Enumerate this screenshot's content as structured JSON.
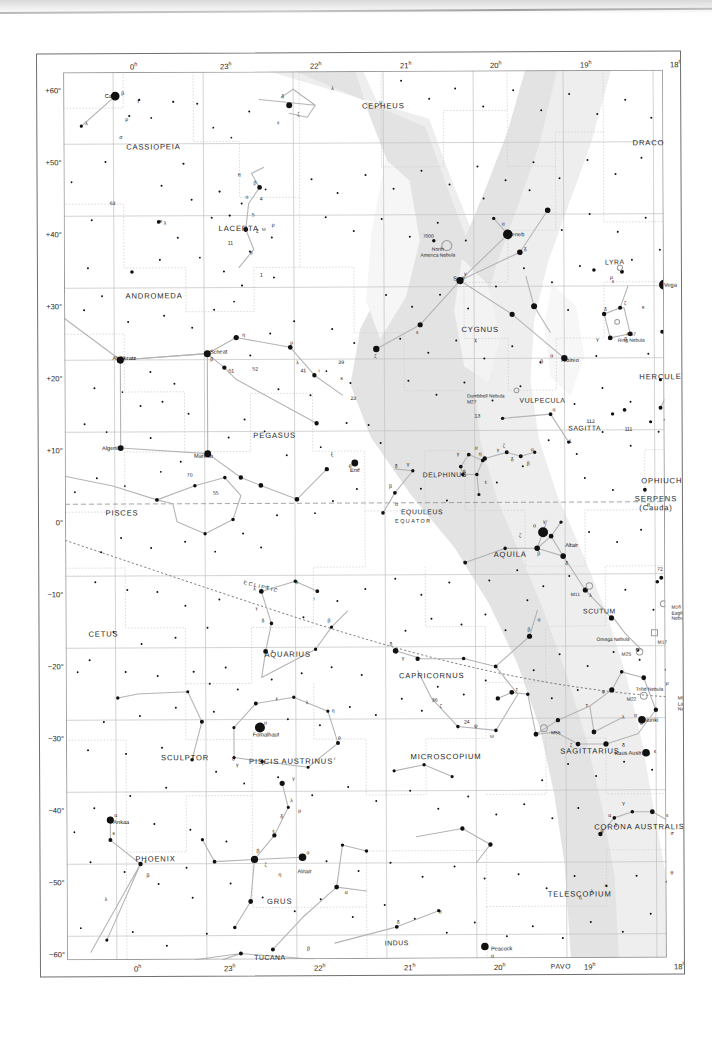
{
  "chart_data": {
    "type": "scatter",
    "projection": "equatorial / cylindrical",
    "xlabel": "Right Ascension",
    "ylabel": "Declination",
    "xlim": [
      0,
      18
    ],
    "ylim": [
      -60,
      60
    ],
    "grid": true,
    "ra_hours_ticks": [
      "0",
      "23",
      "22",
      "21",
      "20",
      "19",
      "18"
    ],
    "ra_tick_labels": [
      "0ʰ",
      "23ʰ",
      "22ʰ",
      "21ʰ",
      "20ʰ",
      "19ʰ",
      "18ʰ"
    ],
    "dec_ticks": [
      60,
      50,
      40,
      30,
      20,
      10,
      0,
      -10,
      -20,
      -30,
      -40,
      -50,
      -60
    ],
    "dec_tick_labels": [
      "+60°",
      "+50°",
      "+40°",
      "+30°",
      "+20°",
      "+10°",
      "0°",
      "−10°",
      "−20°",
      "−30°",
      "−40°",
      "−50°",
      "−60°"
    ],
    "reference_lines": [
      "EQUATOR",
      "ECLIPTIC"
    ],
    "shaded_band": "Milky Way",
    "legend": []
  },
  "axes": {
    "ra_top": [
      {
        "label": "0ʰ",
        "x": 76
      },
      {
        "label": "23ʰ",
        "x": 166
      },
      {
        "label": "22ʰ",
        "x": 256
      },
      {
        "label": "21ʰ",
        "x": 346
      },
      {
        "label": "20ʰ",
        "x": 436
      },
      {
        "label": "19ʰ",
        "x": 526
      },
      {
        "label": "18ʰ",
        "x": 616
      }
    ],
    "ra_bottom": [
      {
        "label": "0ʰ",
        "x": 76
      },
      {
        "label": "23ʰ",
        "x": 166
      },
      {
        "label": "22ʰ",
        "x": 256
      },
      {
        "label": "21ʰ",
        "x": 346
      },
      {
        "label": "20ʰ",
        "x": 436
      },
      {
        "label": "19ʰ",
        "x": 526
      },
      {
        "label": "18ʰ",
        "x": 616
      }
    ],
    "dec_left": [
      {
        "label": "+60°",
        "y": 18
      },
      {
        "label": "+50°",
        "y": 90
      },
      {
        "label": "+40°",
        "y": 162
      },
      {
        "label": "+30°",
        "y": 234
      },
      {
        "label": "+20°",
        "y": 306
      },
      {
        "label": "+10°",
        "y": 378
      },
      {
        "label": "0°",
        "y": 450
      },
      {
        "label": "−10°",
        "y": 522
      },
      {
        "label": "−20°",
        "y": 594
      },
      {
        "label": "−30°",
        "y": 666
      },
      {
        "label": "−40°",
        "y": 738
      },
      {
        "label": "−50°",
        "y": 810
      },
      {
        "label": "−60°",
        "y": 882
      }
    ]
  },
  "reference_labels": [
    {
      "name": "equator-label",
      "text": "EQUATOR",
      "x": 330,
      "y": 447,
      "rot": 0
    },
    {
      "name": "ecliptic-label",
      "text": "ECLIPTIC",
      "x": 178,
      "y": 512,
      "rot": 14
    }
  ],
  "constellations": [
    {
      "name": "CASSIOPEIA",
      "x": 90,
      "y": 75
    },
    {
      "name": "CEPHEUS",
      "x": 320,
      "y": 35
    },
    {
      "name": "DRACO",
      "x": 585,
      "y": 73
    },
    {
      "name": "LACERTA",
      "x": 175,
      "y": 157
    },
    {
      "name": "CYGNUS",
      "x": 416,
      "y": 259
    },
    {
      "name": "LYRA",
      "x": 551,
      "y": 192
    },
    {
      "name": "ANDROMEDA",
      "x": 90,
      "y": 224
    },
    {
      "name": "VULPECULA",
      "x": 478,
      "y": 330
    },
    {
      "name": "SAGITTA",
      "x": 520,
      "y": 358
    },
    {
      "name": "HERCULES",
      "x": 599,
      "y": 307
    },
    {
      "name": "PEGASUS",
      "x": 210,
      "y": 364
    },
    {
      "name": "DELPHINUS",
      "x": 380,
      "y": 404
    },
    {
      "name": "EQUULEUS",
      "x": 357,
      "y": 441
    },
    {
      "name": "OPHIUCHUS",
      "x": 603,
      "y": 411
    },
    {
      "name": "PISCES",
      "x": 57,
      "y": 441
    },
    {
      "name": "AQUILA",
      "x": 445,
      "y": 484
    },
    {
      "name": "SCUTUM",
      "x": 534,
      "y": 541
    },
    {
      "name": "AQUARIUS",
      "x": 222,
      "y": 583
    },
    {
      "name": "CETUS",
      "x": 38,
      "y": 562
    },
    {
      "name": "CAPRICORNUS",
      "x": 366,
      "y": 605
    },
    {
      "name": "SAGITTARIUS",
      "x": 524,
      "y": 681
    },
    {
      "name": "SCULPTOR",
      "x": 119,
      "y": 686
    },
    {
      "name": "PISCIS AUSTRINUS",
      "x": 225,
      "y": 690
    },
    {
      "name": "MICROSCOPIUM",
      "x": 380,
      "y": 686
    },
    {
      "name": "PHOENIX",
      "x": 89,
      "y": 787
    },
    {
      "name": "GRUS",
      "x": 213,
      "y": 830
    },
    {
      "name": "CORONA AUSTRALIS",
      "x": 573,
      "y": 757
    },
    {
      "name": "TELESCOPIUM",
      "x": 513,
      "y": 824
    },
    {
      "name": "ARA",
      "x": 631,
      "y": 827
    },
    {
      "name": "INDUS",
      "x": 330,
      "y": 872
    },
    {
      "name": "TUCANA",
      "x": 203,
      "y": 886
    },
    {
      "name": "PAVO",
      "x": 494,
      "y": 896
    },
    {
      "name": "SERPENS\n(Cauda)",
      "x": 591,
      "y": 434
    }
  ],
  "named_stars": [
    {
      "name": "Caph",
      "x": 55,
      "y": 24,
      "anchor": "right"
    },
    {
      "name": "Deneb",
      "x": 444,
      "y": 164,
      "anchor": "left"
    },
    {
      "name": "Sadr",
      "x": 401,
      "y": 208,
      "anchor": "right"
    },
    {
      "name": "Vega",
      "x": 600,
      "y": 215,
      "anchor": "left"
    },
    {
      "name": "Albireo",
      "x": 497,
      "y": 290,
      "anchor": "left"
    },
    {
      "name": "Alpheratz",
      "x": 60,
      "y": 286,
      "anchor": "center"
    },
    {
      "name": "Scheat",
      "x": 163,
      "y": 280,
      "anchor": "right"
    },
    {
      "name": "Algenib",
      "x": 56,
      "y": 376,
      "anchor": "right"
    },
    {
      "name": "Markab",
      "x": 148,
      "y": 384,
      "anchor": "right"
    },
    {
      "name": "Enif",
      "x": 290,
      "y": 399,
      "anchor": "center"
    },
    {
      "name": "Altair",
      "x": 500,
      "y": 475,
      "anchor": "left"
    },
    {
      "name": "Nunki",
      "x": 578,
      "y": 650,
      "anchor": "left"
    },
    {
      "name": "Kaus Australis",
      "x": 584,
      "y": 683,
      "anchor": "right"
    },
    {
      "name": "Fomalhaut",
      "x": 200,
      "y": 663,
      "anchor": "center"
    },
    {
      "name": "Ankaa",
      "x": 47,
      "y": 750,
      "anchor": "left"
    },
    {
      "name": "Alnair",
      "x": 238,
      "y": 800,
      "anchor": "center"
    },
    {
      "name": "Peacock",
      "x": 424,
      "y": 878,
      "anchor": "left"
    }
  ],
  "deep_sky": [
    {
      "label": "7000",
      "x": 370,
      "y": 163,
      "align": "right"
    },
    {
      "label": "North\nAmerica Nebula",
      "x": 374,
      "y": 176,
      "align": "center"
    },
    {
      "label": "M57\nRing Nebula",
      "x": 567,
      "y": 262,
      "align": "center"
    },
    {
      "label": "Dumbbell Nebula\nM27",
      "x": 440,
      "y": 323,
      "align": "right"
    },
    {
      "label": "M11",
      "x": 510,
      "y": 522,
      "align": "center"
    },
    {
      "label": "M16\nEagle\nNebula",
      "x": 606,
      "y": 535,
      "align": "left"
    },
    {
      "label": "Omega Nebula",
      "x": 531,
      "y": 567,
      "align": "left"
    },
    {
      "label": "M17",
      "x": 592,
      "y": 570,
      "align": "left"
    },
    {
      "label": "M25",
      "x": 556,
      "y": 582,
      "align": "left"
    },
    {
      "label": "M24",
      "x": 623,
      "y": 580,
      "align": "left"
    },
    {
      "label": "M20",
      "x": 629,
      "y": 608,
      "align": "left"
    },
    {
      "label": "Trifid Nebula",
      "x": 570,
      "y": 617,
      "align": "left"
    },
    {
      "label": "M22",
      "x": 561,
      "y": 627,
      "align": "left"
    },
    {
      "label": "M8\nLagoon\nNebula",
      "x": 612,
      "y": 626,
      "align": "left"
    },
    {
      "label": "M55",
      "x": 485,
      "y": 660,
      "align": "left"
    }
  ]
}
